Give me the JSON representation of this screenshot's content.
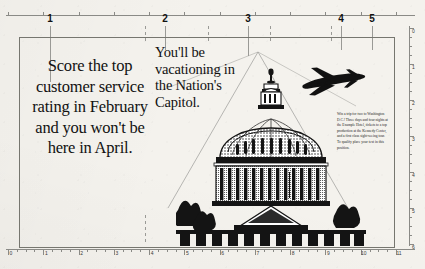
{
  "document": {
    "title": "Washington D.C. Trip Advertisement Layout",
    "type": "print-ad-layout-proof"
  },
  "rulers": {
    "horizontal": {
      "unit": "inches",
      "start": 0,
      "end": 11,
      "labels": [
        "0",
        "1",
        "2",
        "3",
        "4",
        "5",
        "6",
        "7",
        "8",
        "9",
        "10",
        "11"
      ]
    },
    "vertical": {
      "unit": "inches",
      "start": 0,
      "end": 6,
      "labels": [
        "0",
        "1",
        "2",
        "3",
        "4",
        "5",
        "6"
      ]
    }
  },
  "column_guides": {
    "labels": [
      "1",
      "2",
      "3",
      "4",
      "5"
    ],
    "positions_px": [
      50,
      165,
      248,
      341,
      372
    ]
  },
  "headlines": {
    "left": "Score the top customer service rating in February and you won't be here in April.",
    "right": "You'll be vacationing in the Nation's Capitol."
  },
  "body_copy": {
    "text": "Win a trip for two to Washington D.C.! Three days and four nights at the Example Hotel, tickets to a top production at the Kennedy Center, and a first class sight-seeing tour. To qualify place your text in this position."
  },
  "artwork": {
    "capitol": "us-capitol-building-engraving",
    "airplane": "airplane-silhouette"
  },
  "colors": {
    "paper": "#f4f2ed",
    "ink": "#111111",
    "rule": "#8a8a86",
    "guide": "#9a9a96"
  }
}
